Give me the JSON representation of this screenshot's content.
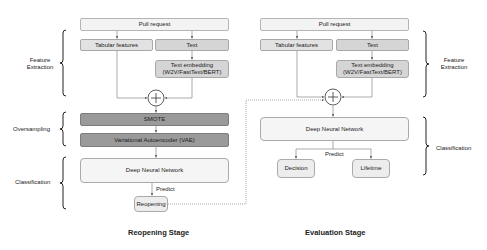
{
  "reopening_stage": {
    "title": "Reopening Stage",
    "pull_request": "Pull request",
    "tabular_features": "Tabular features",
    "text": "Text",
    "text_embedding_line1": "Text embedding",
    "text_embedding_line2": "(W2V/FastText/BERT)",
    "smote": "SMOTE",
    "vae": "Variational Autoencoder (VAE)",
    "dnn": "Deep Neural Network",
    "predict": "Predict",
    "output": "Reopening",
    "brackets": {
      "feature_extraction_line1": "Feature",
      "feature_extraction_line2": "Extraction",
      "oversampling": "Oversampling",
      "classification": "Classification"
    }
  },
  "evaluation_stage": {
    "title": "Evaluation Stage",
    "pull_request": "Pull request",
    "tabular_features": "Tabular features",
    "text": "Text",
    "text_embedding_line1": "Text embedding",
    "text_embedding_line2": "(W2V/FastText/BERT)",
    "dnn": "Deep Neural Network",
    "predict": "Predict",
    "outputs": [
      "Decision",
      "Lifetime"
    ],
    "brackets": {
      "feature_extraction_line1": "Feature",
      "feature_extraction_line2": "Extraction",
      "classification": "Classification"
    }
  },
  "colors": {
    "light_box": "#f3f3f3",
    "mid_box": "#d5d5d5",
    "dark_box": "#9a9a9a",
    "line": "#777777"
  }
}
